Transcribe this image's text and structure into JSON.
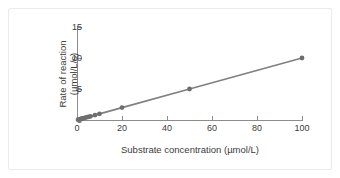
{
  "figure": {
    "background_color": "#ffffff",
    "frame_color": "#ebebeb",
    "axis_color": "#8c8c8c",
    "text_color": "#3c3c3c"
  },
  "chart_data": {
    "type": "line",
    "title": "",
    "subtitle": "",
    "xlabel": "Substrate concentration (µmol/L)",
    "ylabel": "Rate of reaction\n(µmol/L/s)",
    "ylabel_line1": "Rate of reaction",
    "ylabel_line2": "(µmol/L/s)",
    "xlim": [
      0,
      100
    ],
    "ylim": [
      0,
      15
    ],
    "xticks": [
      0,
      20,
      40,
      60,
      80,
      100
    ],
    "yticks": [
      0,
      5,
      10,
      15
    ],
    "xticklabels": [
      "0",
      "20",
      "40",
      "60",
      "80",
      "100"
    ],
    "yticklabels": [
      "0",
      "5",
      "10",
      "15"
    ],
    "grid": false,
    "legend": false,
    "legend_position": "none",
    "series": [
      {
        "name": "Reaction rate vs substrate concentration",
        "color": "#808080",
        "marker": "circle",
        "marker_size": 2.4,
        "line_width": 1.8,
        "x": [
          0.5,
          1,
          1.5,
          2,
          2.5,
          3,
          4,
          5,
          6,
          8,
          10,
          20,
          50,
          100
        ],
        "y": [
          0.05,
          0.1,
          0.15,
          0.2,
          0.25,
          0.3,
          0.4,
          0.5,
          0.6,
          0.8,
          1.0,
          2.0,
          5.0,
          10.0
        ]
      }
    ],
    "annotations": [],
    "relationship": "linear, rate = 0.1 × [substrate]"
  }
}
